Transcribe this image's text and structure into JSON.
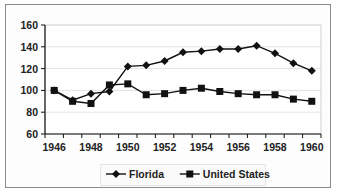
{
  "chart_data": {
    "type": "line",
    "title": "",
    "xlabel": "",
    "ylabel": "",
    "categories": [
      "1946",
      "1947",
      "1948",
      "1949",
      "1950",
      "1951",
      "1952",
      "1953",
      "1954",
      "1955",
      "1956",
      "1957",
      "1958",
      "1959",
      "1960"
    ],
    "x_tick_labels": [
      "1946",
      "1948",
      "1950",
      "1952",
      "1954",
      "1956",
      "1958",
      "1960"
    ],
    "y_tick_labels": [
      "60",
      "80",
      "100",
      "120",
      "140",
      "160"
    ],
    "ylim": [
      60,
      160
    ],
    "grid": true,
    "legend_position": "bottom",
    "series": [
      {
        "name": "Florida",
        "marker": "diamond",
        "color": "#111111",
        "values": [
          100,
          91,
          97,
          99,
          122,
          123,
          127,
          135,
          136,
          138,
          138,
          141,
          134,
          125,
          118
        ]
      },
      {
        "name": "United States",
        "marker": "square",
        "color": "#111111",
        "values": [
          100,
          90,
          88,
          105,
          106,
          96,
          97,
          100,
          102,
          99,
          97,
          96,
          96,
          92,
          90
        ]
      }
    ]
  },
  "legend": {
    "items": [
      {
        "label": "Florida",
        "icon": "diamond-marker-icon"
      },
      {
        "label": "United States",
        "icon": "square-marker-icon"
      }
    ]
  }
}
